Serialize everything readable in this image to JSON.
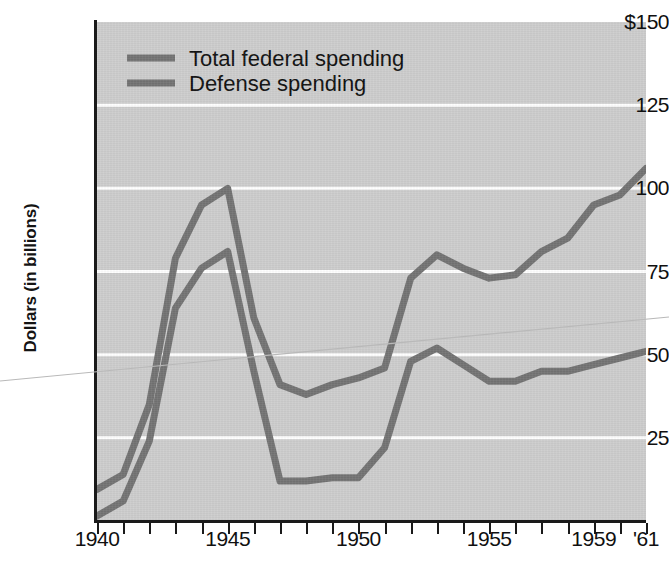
{
  "chart_data": {
    "type": "line",
    "title": "",
    "xlabel": "",
    "ylabel": "Dollars (in billions)",
    "x": [
      1940,
      1941,
      1942,
      1943,
      1944,
      1945,
      1946,
      1947,
      1948,
      1949,
      1950,
      1951,
      1952,
      1953,
      1954,
      1955,
      1956,
      1957,
      1958,
      1959,
      1960,
      1961
    ],
    "xlim": [
      1940,
      1961
    ],
    "ylim": [
      0,
      150
    ],
    "grid": "horizontal-white-gridlines",
    "legend_position": "top-left-inside-plot",
    "xtick_labels": [
      "1940",
      "1945",
      "1950",
      "1955",
      "1959",
      "'61"
    ],
    "xtick_values": [
      1940,
      1945,
      1950,
      1955,
      1959,
      1961
    ],
    "ytick_labels": [
      "$150",
      "125",
      "100",
      "75",
      "50",
      "25"
    ],
    "ytick_values": [
      150,
      125,
      100,
      75,
      50,
      25
    ],
    "series": [
      {
        "name": "Total federal spending",
        "color": "#737373",
        "values": [
          9.5,
          14,
          35,
          79,
          95,
          100,
          61,
          41,
          38,
          41,
          43,
          46,
          73,
          80,
          76,
          73,
          74,
          81,
          85,
          95,
          98,
          106
        ]
      },
      {
        "name": "Defense spending",
        "color": "#737373",
        "values": [
          1.5,
          6,
          24,
          64,
          76,
          81,
          45,
          12,
          12,
          13,
          13,
          22,
          48,
          52,
          47,
          42,
          42,
          45,
          45,
          47,
          49,
          51
        ]
      }
    ]
  },
  "axis": {
    "y_title": "Dollars (in billions)",
    "y_ticks": [
      {
        "label": "$150",
        "value": 150
      },
      {
        "label": "125",
        "value": 125
      },
      {
        "label": "100",
        "value": 100
      },
      {
        "label": "75",
        "value": 75
      },
      {
        "label": "50",
        "value": 50
      },
      {
        "label": "25",
        "value": 25
      }
    ],
    "x_ticks": [
      {
        "label": "1940",
        "value": 1940
      },
      {
        "label": "1945",
        "value": 1945
      },
      {
        "label": "1950",
        "value": 1950
      },
      {
        "label": "1955",
        "value": 1955
      },
      {
        "label": "1959",
        "value": 1959
      },
      {
        "label": "'61",
        "value": 1961
      }
    ]
  },
  "legend": {
    "items": [
      {
        "label": "Total federal spending",
        "color": "#737373"
      },
      {
        "label": "Defense spending",
        "color": "#737373"
      }
    ]
  },
  "colors": {
    "plot_background": "#cdcdcd",
    "gridline": "#ffffff",
    "axis": "#1a1a1a",
    "line": "#737373",
    "page_background": "#ffffff",
    "text": "#101010"
  }
}
